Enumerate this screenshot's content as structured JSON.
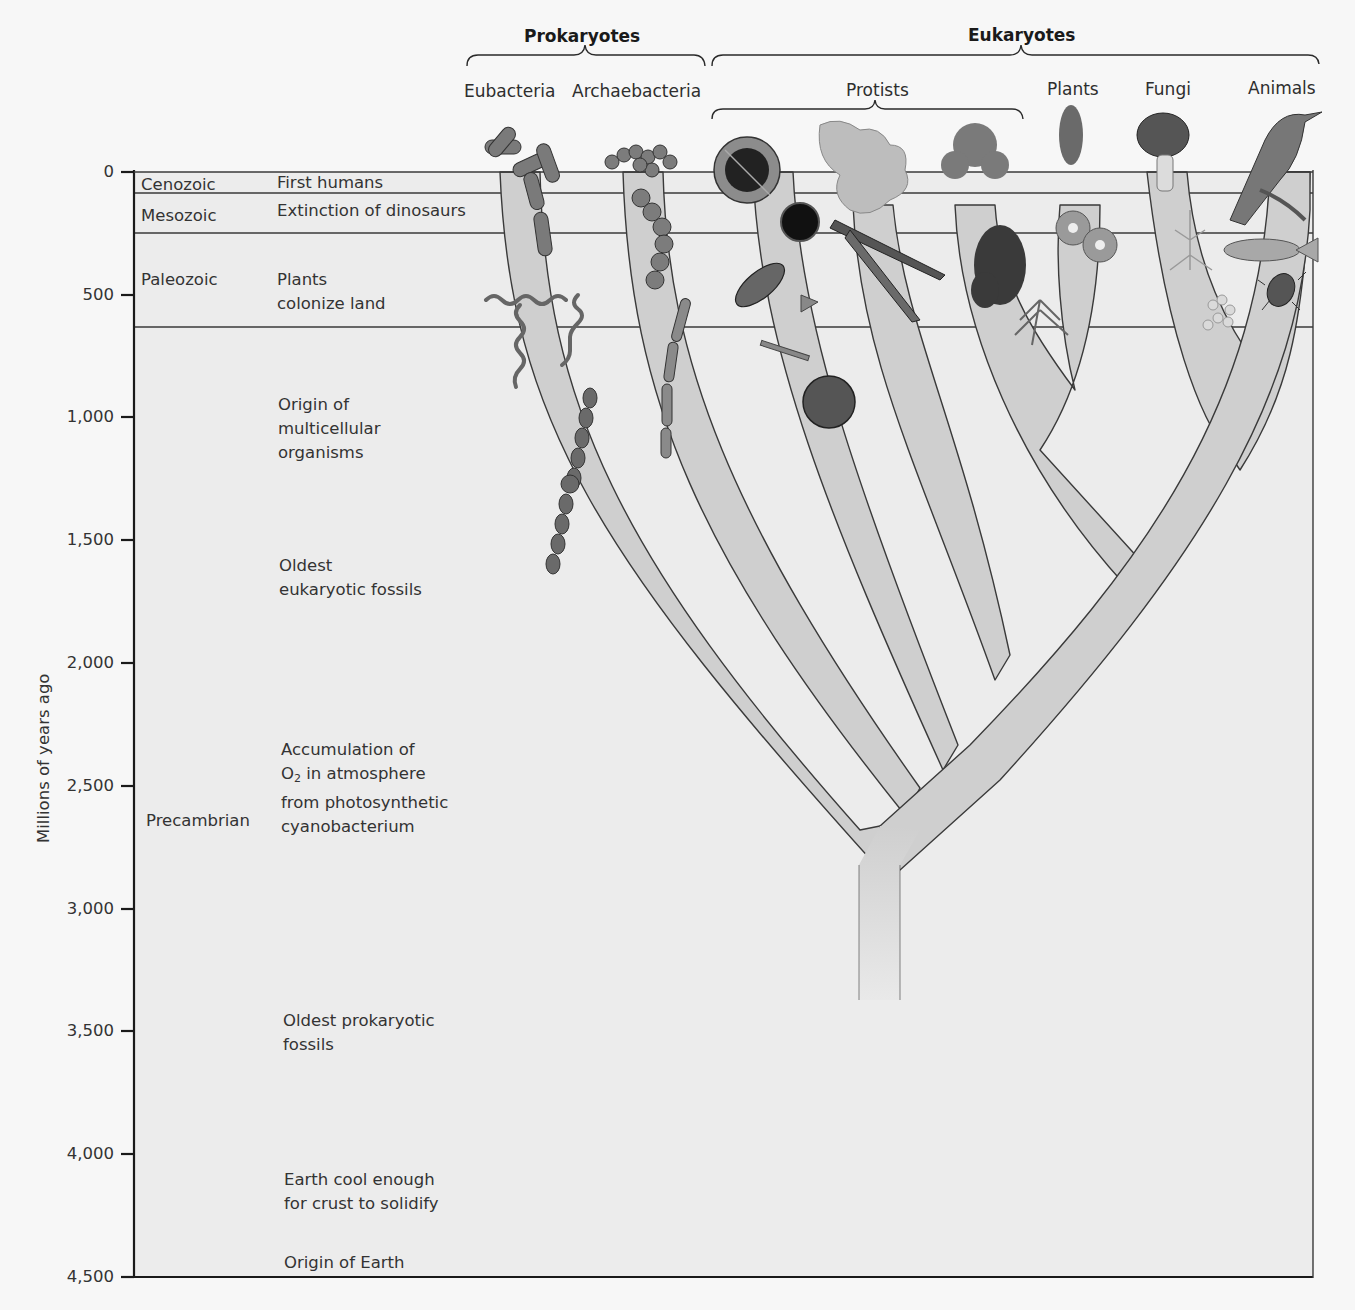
{
  "figure": {
    "y_axis": {
      "label": "Millions of years ago",
      "ticks": [
        {
          "value": 0,
          "label": "0"
        },
        {
          "value": 500,
          "label": "500"
        },
        {
          "value": 1000,
          "label": "1,000"
        },
        {
          "value": 1500,
          "label": "1,500"
        },
        {
          "value": 2000,
          "label": "2,000"
        },
        {
          "value": 2500,
          "label": "2,500"
        },
        {
          "value": 3000,
          "label": "3,000"
        },
        {
          "value": 3500,
          "label": "3,500"
        },
        {
          "value": 4000,
          "label": "4,000"
        },
        {
          "value": 4500,
          "label": "4,500"
        }
      ],
      "range": [
        0,
        4500
      ]
    },
    "groups": {
      "prokaryotes": "Prokaryotes",
      "eukaryotes": "Eukaryotes",
      "protists": "Protists"
    },
    "taxa": [
      {
        "name": "Eubacteria"
      },
      {
        "name": "Archaebacteria"
      },
      {
        "name": "Plants"
      },
      {
        "name": "Fungi"
      },
      {
        "name": "Animals"
      }
    ],
    "eras": [
      {
        "name": "Cenozoic",
        "start": 65,
        "end": 0
      },
      {
        "name": "Mesozoic",
        "start": 250,
        "end": 65
      },
      {
        "name": "Paleozoic",
        "start": 570,
        "end": 250
      },
      {
        "name": "Precambrian",
        "start": 4500,
        "end": 570
      }
    ],
    "events": [
      {
        "text": "First humans"
      },
      {
        "text": "Extinction of dinosaurs"
      },
      {
        "text_lines": [
          "Plants",
          "colonize land"
        ]
      },
      {
        "text_lines": [
          "Origin of",
          "multicellular",
          "organisms"
        ]
      },
      {
        "text_lines": [
          "Oldest",
          "eukaryotic fossils"
        ]
      },
      {
        "line1": "Accumulation of",
        "line2_pre": "O",
        "line2_sub": "2",
        "line2_post": " in atmosphere",
        "line3": "from photosynthetic",
        "line4": "cyanobacterium"
      },
      {
        "text_lines": [
          "Oldest prokaryotic",
          "fossils"
        ]
      },
      {
        "text_lines": [
          "Earth cool enough",
          "for crust to solidify"
        ]
      },
      {
        "text": "Origin of Earth"
      }
    ],
    "organism_icons": [
      "rod-bacteria-icon",
      "spiral-bacteria-icon",
      "filament-cyanobacteria-icon",
      "coccus-chain-icon",
      "archaea-filament-icon",
      "radiolarian-icon",
      "diatom-icon",
      "amoeba-icon",
      "algae-icon",
      "flower-icon",
      "fern-icon",
      "mushroom-icon",
      "mold-icon",
      "yeast-icon",
      "bird-icon",
      "fish-icon",
      "beetle-icon"
    ],
    "colors": {
      "page": "#f7f7f7",
      "chart_bg": "#ececec",
      "branch_fill": "#cfcfcf",
      "branch_stroke": "#3a3a3a",
      "axis": "#1a1a1a",
      "text": "#2e2e2e"
    }
  }
}
